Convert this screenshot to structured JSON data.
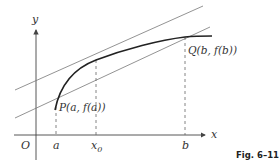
{
  "figure": {
    "caption": "Fig. 6–11"
  },
  "axes": {
    "x_label": "x",
    "y_label": "y",
    "origin_label": "O"
  },
  "ticks": {
    "a": "a",
    "x0": "x",
    "x0_sub": "0",
    "b": "b"
  },
  "points": {
    "P": "P(a, f(a))",
    "Q": "Q(b, f(b))"
  },
  "colors": {
    "curve": "#222222",
    "lines": "#777777",
    "axes": "#444444",
    "dashed": "#666666"
  }
}
